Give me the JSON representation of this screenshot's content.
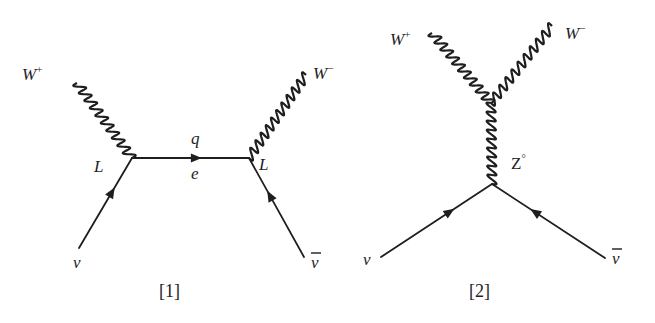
{
  "figure": {
    "diagrams": [
      {
        "id": "diagram-1",
        "caption": "[1]",
        "labels": {
          "w_plus": "W",
          "w_plus_sup": "+",
          "w_minus": "W",
          "w_minus_sup": "−",
          "vertex_left": "L",
          "vertex_right": "L",
          "propagator_top": "q",
          "propagator_bottom": "e",
          "neutrino": "ν",
          "antineutrino": "ν"
        },
        "edges": [
          {
            "from": "nu",
            "to": "vertex-left",
            "type": "fermion",
            "particle": "ν"
          },
          {
            "from": "vertex-left",
            "to": "vertex-right",
            "type": "fermion",
            "particle": "e"
          },
          {
            "from": "nubar",
            "to": "vertex-right",
            "type": "fermion",
            "particle": "ν̄"
          },
          {
            "from": "vertex-left",
            "to": "w-plus",
            "type": "boson",
            "particle": "W+"
          },
          {
            "from": "vertex-right",
            "to": "w-minus",
            "type": "boson",
            "particle": "W−"
          }
        ]
      },
      {
        "id": "diagram-2",
        "caption": "[2]",
        "labels": {
          "w_plus": "W",
          "w_plus_sup": "+",
          "w_minus": "W",
          "w_minus_sup": "−",
          "z": "Z",
          "z_sup": "°",
          "neutrino": "ν",
          "antineutrino": "ν"
        },
        "edges": [
          {
            "from": "nu",
            "to": "vertex-bottom",
            "type": "fermion",
            "particle": "ν"
          },
          {
            "from": "nubar",
            "to": "vertex-bottom",
            "type": "fermion",
            "particle": "ν̄"
          },
          {
            "from": "vertex-bottom",
            "to": "vertex-top",
            "type": "boson",
            "particle": "Z°"
          },
          {
            "from": "vertex-top",
            "to": "w-plus",
            "type": "boson",
            "particle": "W+"
          },
          {
            "from": "vertex-top",
            "to": "w-minus",
            "type": "boson",
            "particle": "W−"
          }
        ]
      }
    ]
  }
}
